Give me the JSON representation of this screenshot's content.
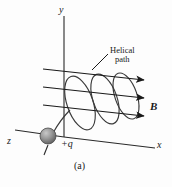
{
  "figure": {
    "caption": "(a)",
    "axes": {
      "y_label": "y",
      "x_label": "x",
      "z_label": "z"
    },
    "field": {
      "label": "B",
      "line_count": 3,
      "direction": "along +x"
    },
    "particle": {
      "charge_label": "+q",
      "sign": "positive",
      "color": "#8a8a8a"
    },
    "annotation": {
      "line1": "Helical",
      "line2": "path",
      "full_text": "Helical path"
    },
    "trajectory": {
      "name": "helical-path",
      "turns": 3
    },
    "colors": {
      "ink": "#1a1a1a",
      "background": "#fdfdfd",
      "sphere_fill": "#8d8d8d",
      "sphere_highlight": "#c9c9c9"
    }
  }
}
